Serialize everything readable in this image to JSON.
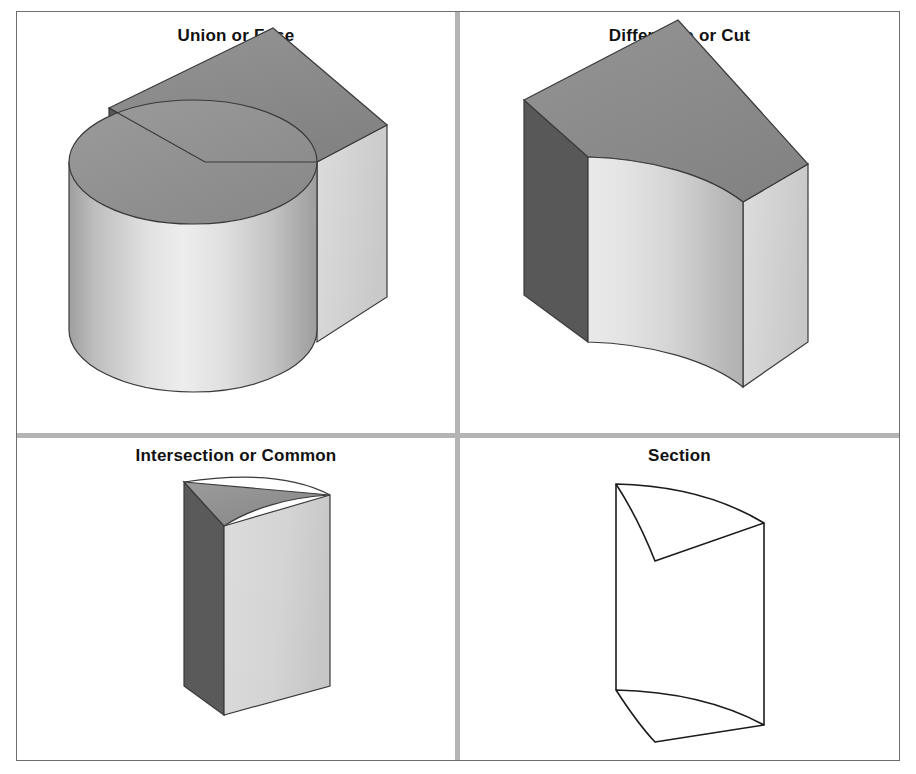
{
  "figure": {
    "caption_font_size": 17,
    "background_color": "#ffffff",
    "frame_color": "#6e6e6e",
    "divider_color": "#b4b4b4"
  },
  "panels": [
    {
      "id": "union",
      "title": "Union or Fuse",
      "shape": "box-and-cylinder-fused",
      "rendering": "shaded",
      "colors": {
        "top_face": "#8c8c8c",
        "left_face": "#575757",
        "right_face": "#d2d2d2",
        "cylinder_top": "#8f8f8f",
        "cylinder_body_light": "#ededed",
        "cylinder_body_dark": "#9a9a9a",
        "outline": "#3a3a3a"
      }
    },
    {
      "id": "difference",
      "title": "Difference or Cut",
      "shape": "box-minus-cylinder",
      "rendering": "shaded",
      "colors": {
        "top_face": "#8c8c8c",
        "left_face": "#585858",
        "right_face": "#d2d2d2",
        "concave_face_light": "#e6e6e6",
        "concave_face_dark": "#b9b9b9",
        "outline": "#3a3a3a"
      }
    },
    {
      "id": "intersection",
      "title": "Intersection or Common",
      "shape": "box-and-cylinder-common",
      "rendering": "shaded",
      "colors": {
        "top_face": "#8f8f8f",
        "left_face": "#5a5a5a",
        "right_face": "#d6d6d6",
        "outline": "#3a3a3a"
      }
    },
    {
      "id": "section",
      "title": "Section",
      "shape": "curved-section-wireframe",
      "rendering": "wireframe",
      "colors": {
        "stroke": "#1b1b1b",
        "fill": "#ffffff"
      }
    }
  ]
}
